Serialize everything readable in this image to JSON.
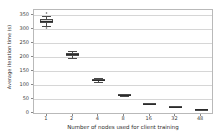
{
  "chart_data": {
    "type": "box",
    "title": "",
    "xlabel": "Number of nodes used for client training",
    "ylabel": "Average iteration time (s)",
    "categories": [
      "1",
      "2",
      "4",
      "8",
      "16",
      "32",
      "48"
    ],
    "xtick_labels": [
      "1",
      "2",
      "4",
      "8",
      "16",
      "32",
      "48"
    ],
    "ytick_labels": [
      "0",
      "50",
      "100",
      "150",
      "200",
      "250",
      "300",
      "350"
    ],
    "ytick_values": [
      0,
      50,
      100,
      150,
      200,
      250,
      300,
      350
    ],
    "ylim": [
      -8,
      368
    ],
    "grid": "horizontal",
    "legend": "none",
    "boxes": [
      {
        "category": "1",
        "whisker_low": 312,
        "q1": 322,
        "median": 330,
        "q3": 337,
        "whisker_high": 348,
        "fliers": [
          356,
          303
        ]
      },
      {
        "category": "2",
        "whisker_low": 196,
        "q1": 205,
        "median": 210,
        "q3": 214,
        "whisker_high": 222,
        "fliers": []
      },
      {
        "category": "4",
        "whisker_low": 110,
        "q1": 115,
        "median": 118,
        "q3": 121,
        "whisker_high": 126,
        "fliers": []
      },
      {
        "category": "8",
        "whisker_low": 61,
        "q1": 63,
        "median": 65,
        "q3": 66,
        "whisker_high": 69,
        "fliers": []
      },
      {
        "category": "16",
        "whisker_low": 30,
        "q1": 32,
        "median": 33,
        "q3": 34,
        "whisker_high": 36,
        "fliers": []
      },
      {
        "category": "32",
        "whisker_low": 19,
        "q1": 21,
        "median": 22,
        "q3": 23,
        "whisker_high": 25,
        "fliers": []
      },
      {
        "category": "48",
        "whisker_low": 10,
        "q1": 11,
        "median": 12,
        "q3": 13,
        "whisker_high": 14,
        "fliers": []
      }
    ],
    "colors": {
      "box_fill": "#d8d8d8",
      "box_edge": "#4a4a4a",
      "median": "#2b2b2b",
      "grid": "#d6d6d6",
      "frame": "#b9b9b9",
      "text": "#3c3c3c",
      "background": "#ffffff"
    }
  }
}
